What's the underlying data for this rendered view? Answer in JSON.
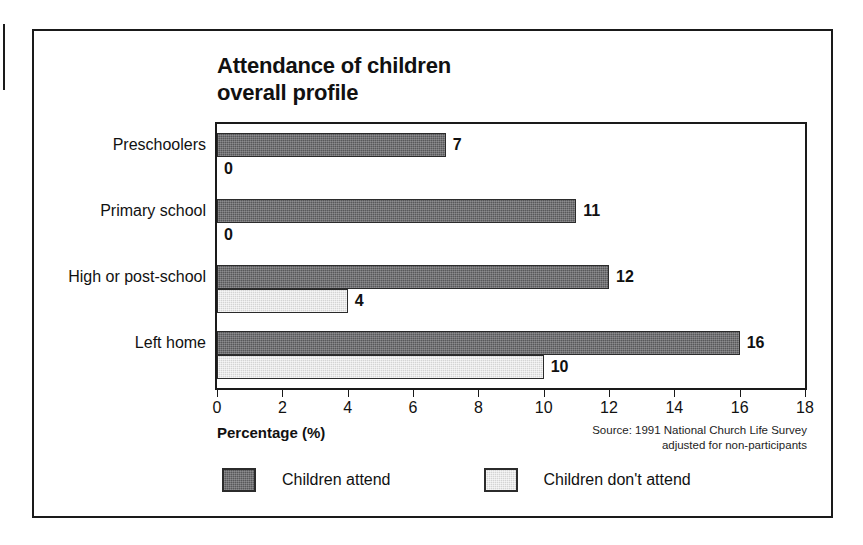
{
  "chart_data": {
    "type": "bar",
    "orientation": "horizontal",
    "title": "Attendance of children\noverall profile",
    "xlabel": "Percentage (%)",
    "ylabel": "",
    "xlim": [
      0,
      18
    ],
    "xticks": [
      0,
      2,
      4,
      6,
      8,
      10,
      12,
      14,
      16,
      18
    ],
    "xtick_labels": [
      "0",
      "2",
      "4",
      "6",
      "8",
      "10",
      "12",
      "14",
      "16",
      "18"
    ],
    "grid": false,
    "legend_position": "bottom-left",
    "categories": [
      "Preschoolers",
      "Primary school",
      "High or post-school",
      "Left home"
    ],
    "series": [
      {
        "name": "Children attend",
        "color": "#58585a",
        "values": [
          7,
          11,
          12,
          16
        ],
        "value_labels": [
          "7",
          "11",
          "12",
          "16"
        ]
      },
      {
        "name": "Children don't attend",
        "color": "#d4d4d4",
        "values": [
          0,
          0,
          4,
          10
        ],
        "value_labels": [
          "0",
          "0",
          "4",
          "10"
        ]
      }
    ],
    "source_note": "Source: 1991 National Church Life Survey\nadjusted for non-participants"
  },
  "legend": {
    "items": [
      {
        "label": "Children attend",
        "swatch": "dark-hatch-swatch"
      },
      {
        "label": "Children don't attend",
        "swatch": "light-hatch-swatch"
      }
    ]
  }
}
